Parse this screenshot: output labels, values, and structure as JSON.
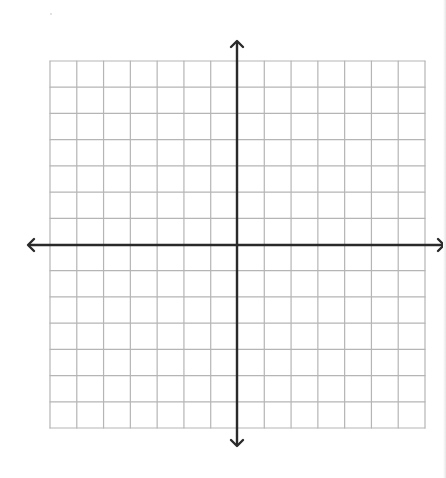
{
  "figure": {
    "type": "coordinate-plane",
    "grid": {
      "columns": 14,
      "rows": 14,
      "cells_left_of_y_axis": 7,
      "cells_right_of_y_axis": 7,
      "cells_above_x_axis": 7,
      "cells_below_x_axis": 7,
      "left": 50,
      "top": 61,
      "right": 425,
      "bottom": 428,
      "line_color": "#b5b5b5"
    },
    "axes": {
      "color": "#2a2a2a",
      "x_axis": {
        "y": 245,
        "from_x": 28,
        "to_x": 444,
        "arrows": [
          "left",
          "right"
        ]
      },
      "y_axis": {
        "x": 237,
        "from_y": 41,
        "to_y": 446,
        "arrows": [
          "up",
          "down"
        ]
      }
    },
    "labels": []
  }
}
